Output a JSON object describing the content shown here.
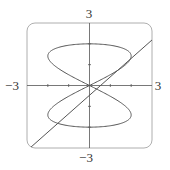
{
  "chart_data": {
    "type": "line",
    "title": "",
    "xlabel": "",
    "ylabel": "",
    "xlim": [
      -3,
      3
    ],
    "ylim": [
      -3,
      3
    ],
    "tick_labels": {
      "x_min": "−3",
      "x_max": "3",
      "y_min": "−3",
      "y_max": "3"
    },
    "ticks": [
      -2,
      -1,
      1,
      2
    ],
    "grid": false,
    "series": [
      {
        "name": "parametric-curve",
        "kind": "parametric",
        "x_expr": "2*sin(2t)",
        "y_expr": "2*sin(t)",
        "t_range": [
          0,
          6.2832
        ]
      },
      {
        "name": "tangent-line",
        "kind": "line",
        "slope": 0.885,
        "intercept": -0.47
      }
    ]
  },
  "colors": {
    "curve": "#555555",
    "frame": "#9a9a9a",
    "axis": "#555555"
  }
}
